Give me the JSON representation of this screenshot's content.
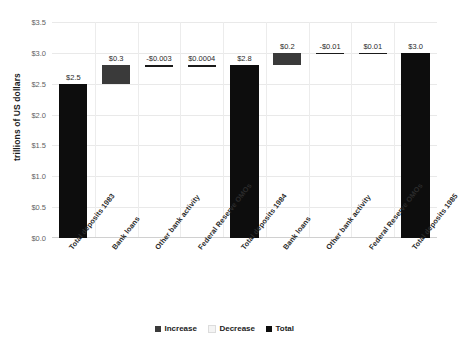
{
  "chart_data": {
    "type": "bar",
    "subtype": "waterfall",
    "title": "",
    "xlabel": "",
    "ylabel": "trillions of US dollars",
    "ylim": [
      0.0,
      3.5
    ],
    "ytick_step": 0.5,
    "ytick_labels": [
      "$0.0",
      "$0.5",
      "$1.0",
      "$1.5",
      "$2.0",
      "$2.5",
      "$3.0",
      "$3.5"
    ],
    "ytick_values": [
      0.0,
      0.5,
      1.0,
      1.5,
      2.0,
      2.5,
      3.0,
      3.5
    ],
    "grid": true,
    "legend_position": "bottom",
    "categories": [
      "Total deposits 1983",
      "Bank loans",
      "Other bank activity",
      "Federal Reserve OMOs",
      "Total deposits 1984",
      "Bank loans",
      "Other bank activity",
      "Federal Reserve OMOs",
      "Total deposits 1985"
    ],
    "values": [
      2.5,
      0.3,
      -0.003,
      0.0004,
      2.8,
      0.2,
      -0.01,
      0.01,
      3.0
    ],
    "value_labels": [
      "$2.5",
      "$0.3",
      "-$0.003",
      "$0.0004",
      "$2.8",
      "$0.2",
      "-$0.01",
      "$0.01",
      "$3.0"
    ],
    "kinds": [
      "total",
      "increase",
      "decrease",
      "increase",
      "total",
      "increase",
      "decrease",
      "increase",
      "total"
    ],
    "bar_start": [
      0.0,
      2.5,
      2.797,
      2.7974,
      0.0,
      2.8,
      2.99,
      2.99,
      0.0
    ],
    "bar_end": [
      2.5,
      2.8,
      2.8,
      2.7978,
      2.8,
      3.0,
      3.0,
      3.0,
      3.0
    ],
    "series": [
      {
        "name": "Increase",
        "color": "#3a3a3a"
      },
      {
        "name": "Decrease",
        "color": "#f4f4f4"
      },
      {
        "name": "Total",
        "color": "#0d0d0d"
      }
    ]
  },
  "legend": {
    "items": [
      {
        "label": "Increase"
      },
      {
        "label": "Decrease"
      },
      {
        "label": "Total"
      }
    ]
  },
  "colors": {
    "increase": "#3a3a3a",
    "decrease": "#f4f4f4",
    "total": "#0d0d0d",
    "grid": "#e9e9e9",
    "text": "#2b2b2b"
  }
}
